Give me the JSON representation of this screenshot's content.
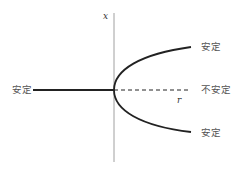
{
  "diagram": {
    "type": "pitchfork-bifurcation",
    "axes": {
      "vertical_label": "x",
      "horizontal_label": "r"
    },
    "branches": {
      "left": {
        "label": "安定",
        "style": "solid"
      },
      "upper": {
        "label": "安定",
        "style": "solid"
      },
      "middle": {
        "label": "不安定",
        "style": "dashed"
      },
      "lower": {
        "label": "安定",
        "style": "solid"
      }
    },
    "colors": {
      "curve": "#222222",
      "axis": "#888888",
      "label": "#555555"
    }
  }
}
